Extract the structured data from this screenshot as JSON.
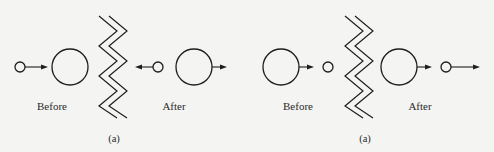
{
  "colors": {
    "stroke": "#1e1e1e",
    "background": "#f4f4f2",
    "text": "#2a2a2a"
  },
  "panels": [
    {
      "id": "left",
      "caption": "(a)",
      "before_label": "Before",
      "after_label": "After",
      "captionPos": [
        114,
        142
      ],
      "beforePos": [
        52,
        110
      ],
      "afterPos": [
        174,
        110
      ],
      "wallX": 99,
      "circles": [
        {
          "cx": 20,
          "cy": 67,
          "r": 5
        },
        {
          "cx": 70,
          "cy": 67,
          "r": 18
        },
        {
          "cx": 158,
          "cy": 67,
          "r": 5
        },
        {
          "cx": 194,
          "cy": 67,
          "r": 18
        }
      ],
      "arrows": [
        {
          "x1": 25,
          "x2": 48,
          "y": 67,
          "dir": "right"
        },
        {
          "x1": 153,
          "x2": 135,
          "y": 67,
          "dir": "left"
        },
        {
          "x1": 212,
          "x2": 227,
          "y": 67,
          "dir": "right"
        }
      ]
    },
    {
      "id": "right",
      "caption": "(a)",
      "before_label": "Before",
      "after_label": "After",
      "captionPos": [
        365,
        142
      ],
      "beforePos": [
        298,
        110
      ],
      "afterPos": [
        420,
        110
      ],
      "wallX": 345,
      "circles": [
        {
          "cx": 281,
          "cy": 67,
          "r": 18
        },
        {
          "cx": 328,
          "cy": 67,
          "r": 5
        },
        {
          "cx": 399,
          "cy": 67,
          "r": 18
        },
        {
          "cx": 446,
          "cy": 67,
          "r": 5
        }
      ],
      "arrows": [
        {
          "x1": 299,
          "x2": 314,
          "y": 67,
          "dir": "right"
        },
        {
          "x1": 417,
          "x2": 432,
          "y": 67,
          "dir": "right"
        },
        {
          "x1": 451,
          "x2": 480,
          "y": 67,
          "dir": "right"
        }
      ]
    }
  ]
}
